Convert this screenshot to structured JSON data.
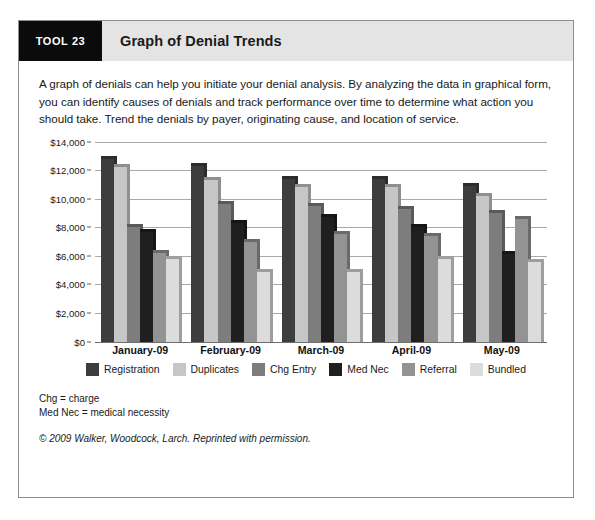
{
  "header": {
    "badge": "TOOL 23",
    "title": "Graph of Denial Trends"
  },
  "intro": "A graph of denials can help you initiate your denial analysis. By analyzing the data in graphical form, you can identify causes of denials and track performance over time to determine what action you should take. Trend the denials by payer, originating cause, and location of service.",
  "footnotes": {
    "line1": "Chg = charge",
    "line2": "Med Nec = medical necessity",
    "copyright": "© 2009 Walker, Woodcock, Larch. Reprinted with permission."
  },
  "chart_data": {
    "type": "bar",
    "title": "Graph of Denial Trends",
    "xlabel": "",
    "ylabel": "",
    "ylim": [
      0,
      14000
    ],
    "grid": true,
    "legend_position": "bottom",
    "categories": [
      "January-09",
      "February-09",
      "March-09",
      "April-09",
      "May-09"
    ],
    "ytick_labels": [
      "$14,000",
      "$12,000",
      "$10,000",
      "$8,000",
      "$6,000",
      "$4,000",
      "$2,000",
      "$0"
    ],
    "ytick_values": [
      14000,
      12000,
      10000,
      8000,
      6000,
      4000,
      2000,
      0
    ],
    "series": [
      {
        "name": "Registration",
        "color": "#3d3d3d",
        "values": [
          12800,
          12300,
          11400,
          11400,
          10900
        ]
      },
      {
        "name": "Duplicates",
        "color": "#c6c6c6",
        "values": [
          12200,
          11300,
          10800,
          10800,
          10200
        ]
      },
      {
        "name": "Chg Entry",
        "color": "#7d7d7d",
        "values": [
          8000,
          9600,
          9500,
          9300,
          9000
        ]
      },
      {
        "name": "Med Nec",
        "color": "#1f1f1f",
        "values": [
          7700,
          8300,
          8700,
          8000,
          6100
        ]
      },
      {
        "name": "Referral",
        "color": "#939393",
        "values": [
          6200,
          7000,
          7500,
          7400,
          8600
        ]
      },
      {
        "name": "Bundled",
        "color": "#dcdcdc",
        "values": [
          5800,
          4900,
          4900,
          5800,
          5600
        ]
      }
    ]
  }
}
